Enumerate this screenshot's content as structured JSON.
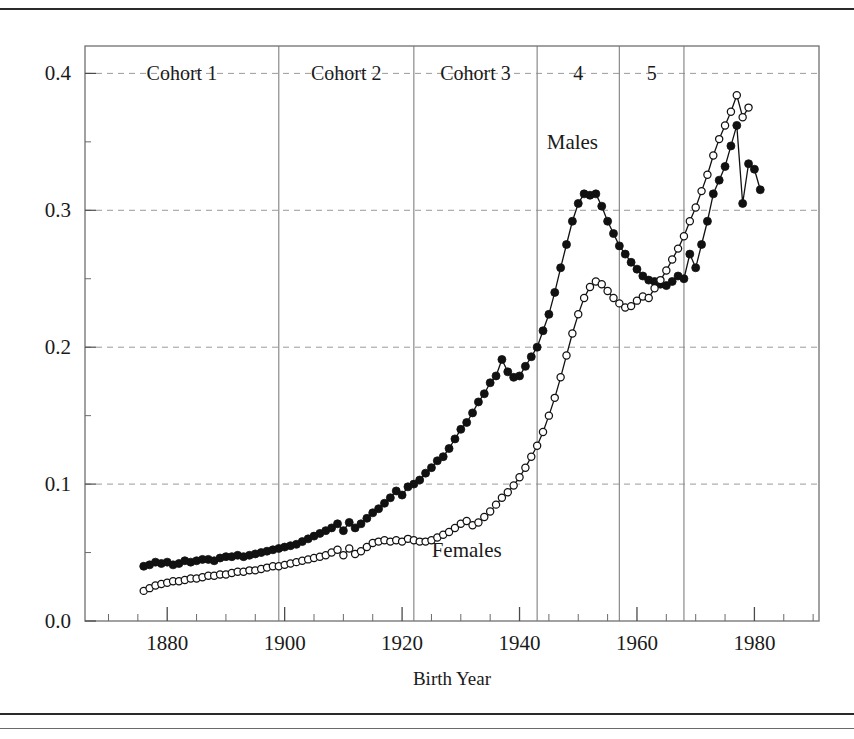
{
  "figure": {
    "name": "birth-cohort-line-chart",
    "background": "#ffffff",
    "frame_color": "#7a7a7a",
    "grid_color": "#9a9a9a",
    "series_color": "#111111"
  },
  "axes": {
    "x": {
      "label": "Birth Year",
      "min": 1866,
      "max": 1991,
      "ticks": [
        1880,
        1900,
        1920,
        1940,
        1960,
        1980
      ],
      "tick_labels": [
        "1880",
        "1900",
        "1920",
        "1940",
        "1960",
        "1980"
      ],
      "minor_tick_step": 5
    },
    "y": {
      "label": "",
      "min": 0.0,
      "max": 0.42,
      "ticks": [
        0.0,
        0.1,
        0.2,
        0.3,
        0.4
      ],
      "tick_labels": [
        "0.0",
        "0.1",
        "0.2",
        "0.3",
        "0.4"
      ],
      "minor_tick_step": 0.05,
      "grid": true
    }
  },
  "cohorts": [
    {
      "label": "Cohort 1",
      "start": 1866,
      "end": 1899
    },
    {
      "label": "Cohort 2",
      "start": 1899,
      "end": 1922
    },
    {
      "label": "Cohort 3",
      "start": 1922,
      "end": 1943
    },
    {
      "label": "4",
      "start": 1943,
      "end": 1957
    },
    {
      "label": "5",
      "start": 1957,
      "end": 1968
    }
  ],
  "annotations": [
    {
      "name": "males-label",
      "text": "Males",
      "x": 1949,
      "y": 0.345
    },
    {
      "name": "females-label",
      "text": "Females",
      "x": 1931,
      "y": 0.047
    }
  ],
  "chart_data": {
    "type": "line",
    "title": "",
    "xlabel": "Birth Year",
    "ylabel": "",
    "xlim": [
      1866,
      1991
    ],
    "ylim": [
      0.0,
      0.42
    ],
    "grid": true,
    "legend": "inline-annotations",
    "x": [
      1876,
      1877,
      1878,
      1879,
      1880,
      1881,
      1882,
      1883,
      1884,
      1885,
      1886,
      1887,
      1888,
      1889,
      1890,
      1891,
      1892,
      1893,
      1894,
      1895,
      1896,
      1897,
      1898,
      1899,
      1900,
      1901,
      1902,
      1903,
      1904,
      1905,
      1906,
      1907,
      1908,
      1909,
      1910,
      1911,
      1912,
      1913,
      1914,
      1915,
      1916,
      1917,
      1918,
      1919,
      1920,
      1921,
      1922,
      1923,
      1924,
      1925,
      1926,
      1927,
      1928,
      1929,
      1930,
      1931,
      1932,
      1933,
      1934,
      1935,
      1936,
      1937,
      1938,
      1939,
      1940,
      1941,
      1942,
      1943,
      1944,
      1945,
      1946,
      1947,
      1948,
      1949,
      1950,
      1951,
      1952,
      1953,
      1954,
      1955,
      1956,
      1957,
      1958,
      1959,
      1960,
      1961,
      1962,
      1963,
      1964,
      1965,
      1966,
      1967,
      1968,
      1969,
      1970,
      1971,
      1972,
      1973,
      1974,
      1975
    ],
    "series": [
      {
        "name": "Males",
        "marker": "filled-circle",
        "values": [
          0.04,
          0.041,
          0.043,
          0.042,
          0.043,
          0.041,
          0.042,
          0.044,
          0.043,
          0.044,
          0.045,
          0.045,
          0.044,
          0.046,
          0.047,
          0.047,
          0.048,
          0.047,
          0.048,
          0.049,
          0.05,
          0.051,
          0.052,
          0.053,
          0.054,
          0.055,
          0.056,
          0.058,
          0.06,
          0.062,
          0.064,
          0.066,
          0.068,
          0.071,
          0.066,
          0.072,
          0.068,
          0.071,
          0.075,
          0.079,
          0.082,
          0.086,
          0.09,
          0.095,
          0.092,
          0.098,
          0.1,
          0.103,
          0.108,
          0.112,
          0.117,
          0.12,
          0.126,
          0.133,
          0.14,
          0.145,
          0.152,
          0.16,
          0.166,
          0.174,
          0.179,
          0.191,
          0.182,
          0.178,
          0.179,
          0.186,
          0.193,
          0.2,
          0.212,
          0.224,
          0.24,
          0.258,
          0.275,
          0.292,
          0.305,
          0.312,
          0.311,
          0.312,
          0.303,
          0.292,
          0.283,
          0.274,
          0.268,
          0.262,
          0.257,
          0.252,
          0.249,
          0.248,
          0.246,
          0.245,
          0.248,
          0.252,
          0.25,
          0.268,
          0.258,
          0.275,
          0.292,
          0.312,
          0.322,
          0.332
        ],
        "values_tail": [
          0.347,
          0.362,
          0.305,
          0.334,
          0.33,
          0.315
        ]
      },
      {
        "name": "Females",
        "marker": "open-circle",
        "values": [
          0.022,
          0.024,
          0.026,
          0.027,
          0.028,
          0.029,
          0.029,
          0.03,
          0.031,
          0.031,
          0.032,
          0.033,
          0.033,
          0.034,
          0.034,
          0.035,
          0.036,
          0.036,
          0.037,
          0.037,
          0.038,
          0.039,
          0.04,
          0.04,
          0.041,
          0.042,
          0.043,
          0.044,
          0.045,
          0.046,
          0.047,
          0.048,
          0.05,
          0.052,
          0.048,
          0.053,
          0.049,
          0.051,
          0.054,
          0.057,
          0.058,
          0.059,
          0.058,
          0.059,
          0.058,
          0.06,
          0.059,
          0.058,
          0.058,
          0.059,
          0.061,
          0.063,
          0.065,
          0.068,
          0.071,
          0.073,
          0.07,
          0.072,
          0.076,
          0.08,
          0.085,
          0.09,
          0.094,
          0.099,
          0.105,
          0.112,
          0.12,
          0.128,
          0.138,
          0.15,
          0.163,
          0.178,
          0.194,
          0.21,
          0.224,
          0.236,
          0.244,
          0.248,
          0.246,
          0.241,
          0.236,
          0.232,
          0.229,
          0.23,
          0.234,
          0.237,
          0.236,
          0.243,
          0.249,
          0.256,
          0.264,
          0.272,
          0.281,
          0.292,
          0.302,
          0.314,
          0.326,
          0.34,
          0.352,
          0.362
        ],
        "values_tail": [
          0.372,
          0.384,
          0.368,
          0.375
        ]
      }
    ]
  }
}
